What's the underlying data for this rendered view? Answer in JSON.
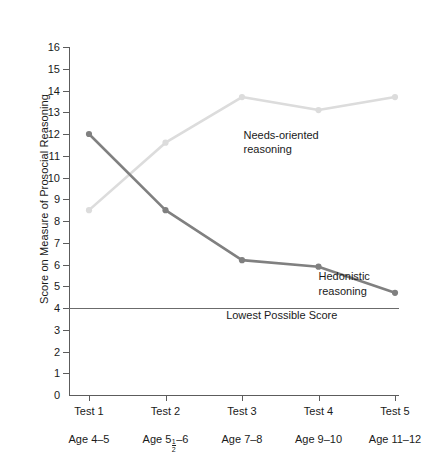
{
  "chart_data": {
    "type": "line",
    "title": "",
    "xlabel": "",
    "ylabel": "Score on Measure of Prosocial Reasoning",
    "categories": [
      "Test 1",
      "Test 2",
      "Test 3",
      "Test 4",
      "Test 5"
    ],
    "category_sublabels": [
      "Age 4–5",
      "Age 5½–6",
      "Age 7–8",
      "Age 9–10",
      "Age 11–12"
    ],
    "ylim": [
      0,
      16
    ],
    "yticks": [
      0,
      1,
      2,
      3,
      4,
      5,
      6,
      7,
      8,
      9,
      10,
      11,
      12,
      13,
      14,
      15,
      16
    ],
    "ytick_labels": [
      "0",
      "1",
      "2",
      "3",
      "4",
      "5",
      "6",
      "7",
      "8",
      "9",
      "10",
      "11",
      "12",
      "13",
      "14",
      "15",
      "16"
    ],
    "grid": false,
    "legend_position": "inline-annotations",
    "series": [
      {
        "name": "Hedonistic reasoning",
        "color": "#808080",
        "marker": "circle",
        "values": [
          12.0,
          8.5,
          6.2,
          5.9,
          4.7
        ]
      },
      {
        "name": "Needs-oriented reasoning",
        "color": "#dcdcdc",
        "marker": "circle",
        "values": [
          8.5,
          11.6,
          13.7,
          13.1,
          13.7
        ]
      }
    ],
    "annotations": [
      {
        "id": "needs-oriented-label",
        "lines": [
          "Needs-oriented",
          "reasoning"
        ],
        "at_x": 2.02,
        "at_y": 11.95
      },
      {
        "id": "hedonistic-label",
        "lines": [
          "Hedonistic",
          "reasoning"
        ],
        "at_x": 3.0,
        "at_y": 5.45
      }
    ],
    "reference_line": {
      "label": "Lowest Possible Score",
      "value": 4,
      "color": "#6b6b6b",
      "label_x": 2.52,
      "label_y": 3.62
    }
  }
}
